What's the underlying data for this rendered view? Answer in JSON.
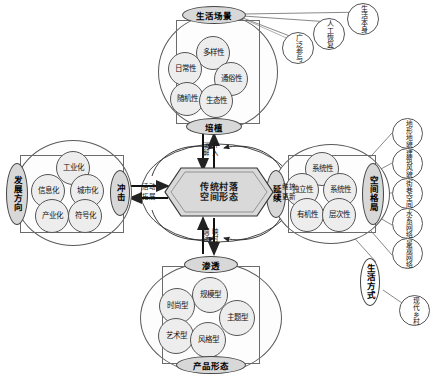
{
  "diagram": {
    "center": {
      "label_line1": "传统村落",
      "label_line2": "空间形态"
    },
    "clusters": {
      "top": {
        "name": "生活场景集群",
        "cap_top": "生活场景",
        "cap_bottom": "培植",
        "attributes": [
          "多样性",
          "日常性",
          "通俗性",
          "随机性",
          "生态性"
        ]
      },
      "left": {
        "name": "发展方向集群",
        "cap_left": "发展方向",
        "cap_right": "冲击",
        "attributes": [
          "工业化",
          "信息化",
          "城市化",
          "产业化",
          "符号化"
        ]
      },
      "right": {
        "name": "空间格局集群",
        "cap_left": "延续",
        "cap_right": "空间格局",
        "attributes": [
          "系统性",
          "独立性",
          "系统性",
          "有机性",
          "层次性"
        ]
      },
      "bottom": {
        "name": "产品形态集群",
        "cap_top": "渗透",
        "cap_bottom": "产品形态",
        "attributes": [
          "规模型",
          "时尚型",
          "主题型",
          "艺术型",
          "风格型"
        ]
      }
    },
    "arrow_labels": {
      "top_left": "消解",
      "top_right": "介入",
      "right_top": "维护",
      "right_bottom": "更新",
      "bottom_left": "调适",
      "bottom_right": "映衬",
      "left_top": "活动",
      "left_bottom": "拓展"
    },
    "satellites": {
      "top_right": [
        "广泛参与",
        "人工恢复",
        "生活本身"
      ],
      "right_column": [
        "地形地貌",
        "建筑风貌",
        "街巷空间",
        "水系网络",
        "景观网络"
      ],
      "bottom_right": [
        "生活方式",
        "现代乡村"
      ]
    },
    "colors": {
      "attr_fill": "#ededed",
      "cap_fill": "#d8d8d8",
      "hex_fill": "#d9d9d9",
      "stroke": "#555555",
      "background": "#ffffff"
    }
  }
}
